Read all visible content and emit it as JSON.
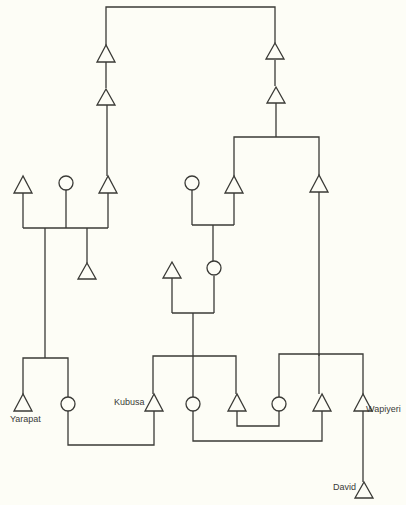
{
  "diagram": {
    "type": "kinship-chart",
    "legend": {
      "triangle": "male",
      "circle": "female"
    },
    "labels": {
      "yarapat": "Yarapat",
      "kubusa": "Kubusa",
      "wapiyeri": "Wapiyeri",
      "david": "David"
    },
    "colors": {
      "line": "#3a3a36",
      "background": "#fdfdf6"
    }
  }
}
